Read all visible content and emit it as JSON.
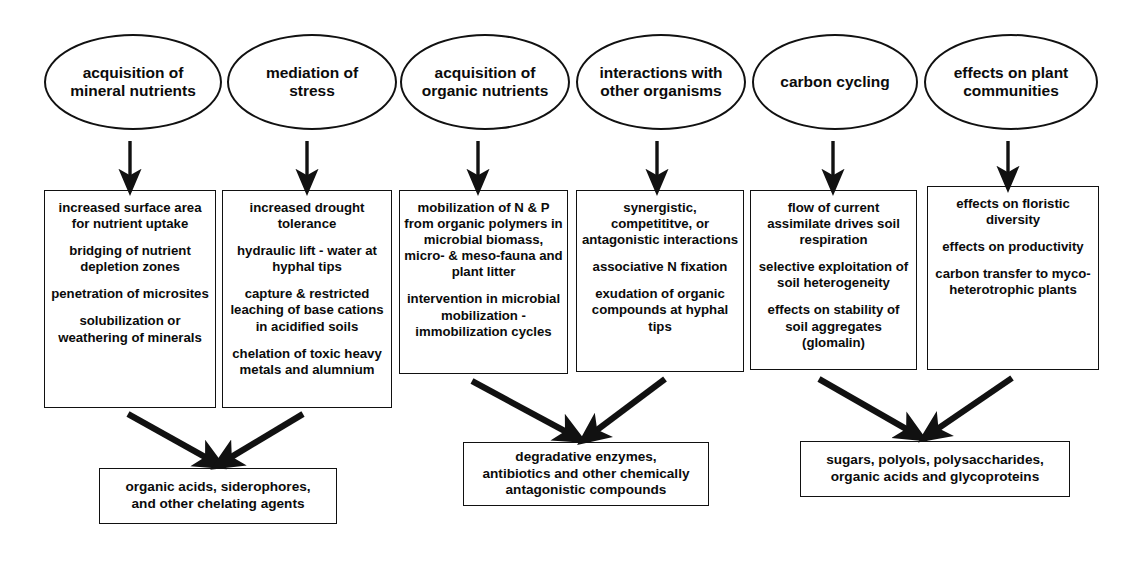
{
  "diagram": {
    "stroke_color": "#111111",
    "background_color": "#ffffff"
  },
  "columns": [
    {
      "oval": "acquisition of\nmineral nutrients",
      "oval_lines": [
        "acquisition of",
        "mineral nutrients"
      ],
      "box_paragraphs": [
        "increased surface area for nutrient uptake",
        "bridging of nutrient depletion zones",
        "penetration of microsites",
        "solubilization or weathering of minerals"
      ]
    },
    {
      "oval": "mediation of\nstress",
      "oval_lines": [
        "mediation of",
        "stress"
      ],
      "box_paragraphs": [
        "increased drought tolerance",
        "hydraulic lift - water at hyphal tips",
        "capture & restricted leaching of base cations in acidified soils",
        "chelation of toxic heavy metals and alumnium"
      ]
    },
    {
      "oval": "acquisition of\norganic nutrients",
      "oval_lines": [
        "acquisition of",
        "organic nutrients"
      ],
      "box_paragraphs": [
        "mobilization of N & P from organic polymers in microbial biomass, micro- & meso-fauna and plant litter",
        "intervention in microbial mobilization -immobilization cycles"
      ]
    },
    {
      "oval": "interactions with\nother organisms",
      "oval_lines": [
        "interactions with",
        "other organisms"
      ],
      "box_paragraphs": [
        "synergistic, competititve, or antagonistic interactions",
        "associative N fixation",
        "exudation of organic compounds at hyphal tips"
      ]
    },
    {
      "oval": "carbon cycling",
      "oval_lines": [
        "carbon cycling"
      ],
      "box_paragraphs": [
        "flow of current assimilate drives soil respiration",
        "selective exploitation of soil heterogeneity",
        "effects on stability of soil aggregates (glomalin)"
      ]
    },
    {
      "oval": "effects on plant\ncommunities",
      "oval_lines": [
        "effects on plant",
        "communities"
      ],
      "box_paragraphs": [
        "effects on floristic diversity",
        "effects on productivity",
        "carbon transfer to myco-heterotrophic plants"
      ]
    }
  ],
  "outcomes": [
    {
      "lines": [
        "organic acids, siderophores,",
        "and other chelating agents"
      ],
      "sources": [
        "acquisition of mineral nutrients",
        "mediation of stress"
      ]
    },
    {
      "lines": [
        "degradative enzymes,",
        "antibiotics and other chemically",
        "antagonistic compounds"
      ],
      "sources": [
        "acquisition of organic nutrients",
        "interactions with other organisms"
      ]
    },
    {
      "lines": [
        "sugars, polyols, polysaccharides,",
        "organic acids and glycoproteins"
      ],
      "sources": [
        "carbon cycling",
        "effects on plant communities"
      ]
    }
  ],
  "arrows": {
    "vertical_count": 6,
    "diagonal_count": 6,
    "description": "straight down arrows from each oval to its box; paired diagonal arrows converging into each outcome box"
  }
}
